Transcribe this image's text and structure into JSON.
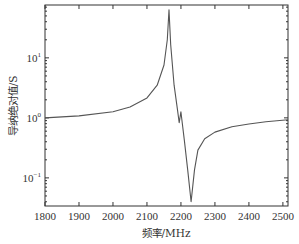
{
  "chart_data": {
    "type": "line",
    "title": "",
    "xlabel": "频率/MHz",
    "ylabel": "导纳绝对值/S",
    "xscale": "linear",
    "yscale": "log",
    "xlim": [
      1800,
      2515
    ],
    "ylim": [
      0.034,
      76
    ],
    "grid": false,
    "legend": null,
    "x_ticks": [
      1800,
      1900,
      2000,
      2100,
      2200,
      2300,
      2400,
      2500
    ],
    "x_tick_labels": [
      "1800",
      "1900",
      "2000",
      "2100",
      "2200",
      "2300",
      "2400",
      "2500"
    ],
    "y_ticks": [
      0.1,
      1,
      10
    ],
    "y_tick_labels": [
      {
        "base": "10",
        "exp": "−1"
      },
      {
        "base": "10",
        "exp": "0"
      },
      {
        "base": "10",
        "exp": "1"
      }
    ],
    "series": [
      {
        "name": "admittance",
        "color": "#555555",
        "x": [
          1800,
          1900,
          2000,
          2050,
          2100,
          2130,
          2150,
          2160,
          2165,
          2170,
          2180,
          2190,
          2195,
          2200,
          2210,
          2220,
          2230,
          2240,
          2250,
          2270,
          2300,
          2350,
          2400,
          2450,
          2515
        ],
        "y": [
          1.0,
          1.08,
          1.26,
          1.52,
          2.15,
          3.5,
          7.6,
          20,
          63,
          16.5,
          3.5,
          1.36,
          0.83,
          1.26,
          0.43,
          0.136,
          0.04,
          0.136,
          0.29,
          0.45,
          0.58,
          0.71,
          0.79,
          0.86,
          0.93
        ]
      }
    ]
  },
  "colors": {
    "axis": "#333333",
    "line": "#555555",
    "background": "#ffffff"
  }
}
